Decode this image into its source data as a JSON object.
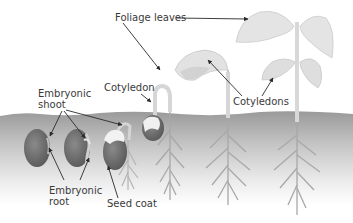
{
  "labels": {
    "foliage_leaves": "Foliage leaves",
    "cotyledon": "Cotyledon",
    "cotyledons": "Cotyledons",
    "embryonic_shoot_line1": "Embryonic",
    "embryonic_shoot_line2": "shoot",
    "embryonic_root_line1": "Embryonic",
    "embryonic_root_line2": "root",
    "seed_coat": "Seed coat"
  },
  "stages": [
    {
      "index": 1,
      "description": "seed with embryonic shoot and root"
    },
    {
      "index": 2,
      "description": "seed with emerging embryonic root"
    },
    {
      "index": 3,
      "description": "seed coat splitting, roots forming"
    },
    {
      "index": 4,
      "description": "hooked stem pulling cotyledon up"
    },
    {
      "index": 5,
      "description": "cotyledons above soil, foliage leaves unfolding"
    },
    {
      "index": 6,
      "description": "mature seedling with foliage leaves and cotyledons"
    }
  ],
  "colors": {
    "soil_top": "#9c9c9c",
    "soil_bottom": "#ffffff",
    "seed": "#6e6e6e",
    "plant": "#d8d8d8",
    "plant_outline": "#c4c4c4",
    "root": "#a8a8a8",
    "arrow": "#2a2a2a",
    "text": "#3a3a3a"
  }
}
